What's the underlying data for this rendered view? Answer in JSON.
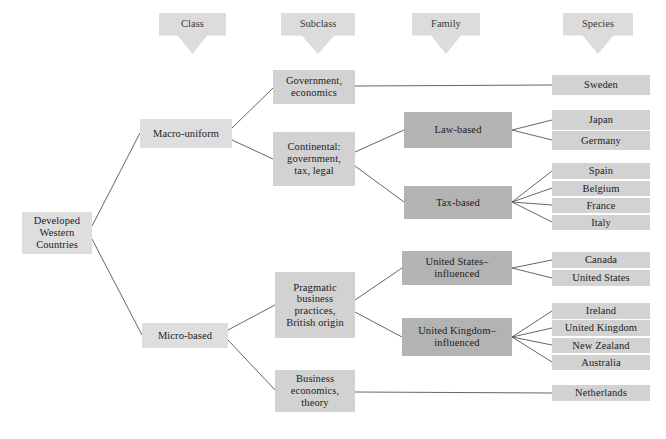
{
  "diagram": {
    "colors": {
      "box_light": "#dedede",
      "box_mid": "#d2d2d2",
      "box_dark": "#b3b3b3",
      "line": "#555555",
      "text": "#1c1c1c",
      "background": "#ffffff"
    },
    "headers": [
      {
        "label": "Class",
        "icon": "down-arrow-banner"
      },
      {
        "label": "Subclass",
        "icon": "down-arrow-banner"
      },
      {
        "label": "Family",
        "icon": "down-arrow-banner"
      },
      {
        "label": "Species",
        "icon": "down-arrow-banner"
      }
    ],
    "root": {
      "label": "Developed\nWestern\nCountries"
    },
    "classes": [
      {
        "label": "Macro-uniform"
      },
      {
        "label": "Micro-based"
      }
    ],
    "subclasses": [
      {
        "label": "Government,\neconomics"
      },
      {
        "label": "Continental:\ngovernment,\ntax, legal"
      },
      {
        "label": "Pragmatic\nbusiness\npractices,\nBritish origin"
      },
      {
        "label": "Business\neconomics,\ntheory"
      }
    ],
    "families": [
      {
        "label": "Law-based"
      },
      {
        "label": "Tax-based"
      },
      {
        "label": "United States–\ninfluenced"
      },
      {
        "label": "United Kingdom–\ninfluenced"
      }
    ],
    "species": [
      {
        "label": "Sweden"
      },
      {
        "label": "Japan"
      },
      {
        "label": "Germany"
      },
      {
        "label": "Spain"
      },
      {
        "label": "Belgium"
      },
      {
        "label": "France"
      },
      {
        "label": "Italy"
      },
      {
        "label": "Canada"
      },
      {
        "label": "United States"
      },
      {
        "label": "Ireland"
      },
      {
        "label": "United Kingdom"
      },
      {
        "label": "New Zealand"
      },
      {
        "label": "Australia"
      },
      {
        "label": "Netherlands"
      }
    ]
  }
}
